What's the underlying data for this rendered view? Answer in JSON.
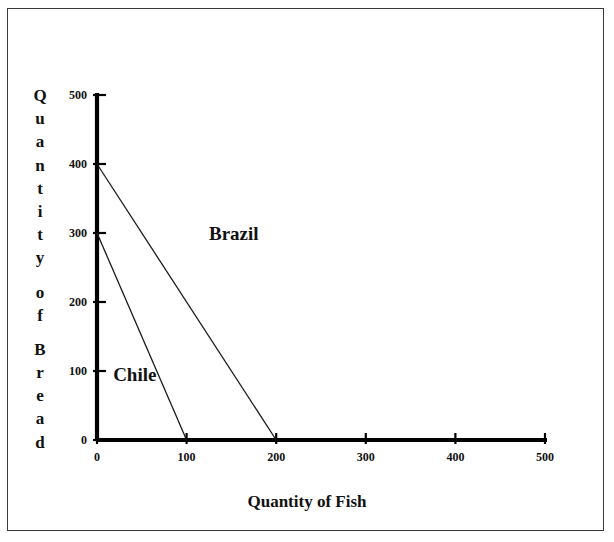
{
  "figure": {
    "background_color": "#ffffff",
    "border_color": "#3a3a3a",
    "axis_color": "#000000",
    "line_color": "#1a1a1a"
  },
  "axis_titles": {
    "y_title": "Quantity of Bread",
    "y_title_glyphs": [
      "Q",
      "u",
      "a",
      "n",
      "t",
      "i",
      "t",
      "y",
      "",
      "o",
      "f",
      "",
      "B",
      "r",
      "e",
      "a",
      "d"
    ],
    "x_title": "Quantity of Fish"
  },
  "chart_data": {
    "type": "line",
    "title": "",
    "subtitle": "",
    "xlabel": "Quantity of Fish",
    "ylabel": "Quantity of Bread",
    "xlim": [
      0,
      500
    ],
    "ylim": [
      0,
      500
    ],
    "xticks": [
      0,
      100,
      200,
      300,
      400,
      500
    ],
    "yticks": [
      0,
      100,
      200,
      300,
      400,
      500
    ],
    "xtick_labels": [
      "0",
      "100",
      "200",
      "300",
      "400",
      "500"
    ],
    "ytick_labels": [
      "0",
      "100",
      "200",
      "300",
      "400",
      "500"
    ],
    "grid": false,
    "legend": "inline-annotations",
    "series": [
      {
        "name": "Brazil",
        "label": "Brazil",
        "x": [
          0,
          200
        ],
        "y": [
          400,
          0
        ],
        "y_intercept": 400,
        "x_intercept": 200,
        "slope": -2,
        "label_x": 125,
        "label_y": 290
      },
      {
        "name": "Chile",
        "label": "Chile",
        "x": [
          0,
          100
        ],
        "y": [
          300,
          0
        ],
        "y_intercept": 300,
        "x_intercept": 100,
        "slope": -3,
        "label_x": 18,
        "label_y": 85
      }
    ],
    "annotations": [
      {
        "text": "Brazil",
        "x": 125,
        "y": 290
      },
      {
        "text": "Chile",
        "x": 18,
        "y": 85
      }
    ]
  }
}
